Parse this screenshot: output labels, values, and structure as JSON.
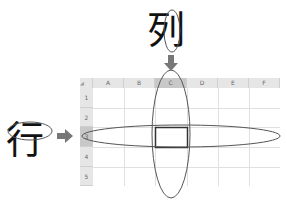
{
  "labels": {
    "column_char": "列",
    "row_char": "行"
  },
  "grid": {
    "corner": "◢",
    "columns": [
      "A",
      "B",
      "C",
      "D",
      "E",
      "F"
    ],
    "rows": [
      "1",
      "2",
      "3",
      "4",
      "5"
    ],
    "selected_column": "C",
    "selected_row": "3"
  },
  "colors": {
    "header_bg": "#e6e6e6",
    "selected_header_bg": "#c8c8c8",
    "arrow": "#777777",
    "ellipse": "#555555",
    "gridline": "#e0e0e0"
  }
}
